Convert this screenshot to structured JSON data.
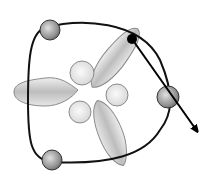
{
  "diagram": {
    "colors": {
      "stroke": "#1a1a1a",
      "lobe_fill": "#d4d4d4",
      "lobe_stroke": "#8a8a8a",
      "sphere_fill": "#9a9a9a",
      "dot": "#000000"
    },
    "spheres": [
      {
        "name": "top-left",
        "cx": 50,
        "cy": 30,
        "r": 10
      },
      {
        "name": "bottom-left",
        "cx": 52,
        "cy": 160,
        "r": 10
      },
      {
        "name": "right",
        "cx": 168,
        "cy": 97,
        "r": 11
      }
    ],
    "center_circles": [
      {
        "cx": 82,
        "cy": 73,
        "r": 12
      },
      {
        "cx": 117,
        "cy": 95,
        "r": 11
      },
      {
        "cx": 80,
        "cy": 112,
        "r": 11
      }
    ],
    "particle": {
      "cx": 132,
      "cy": 39,
      "r": 5
    },
    "arrow": {
      "x1": 132,
      "y1": 39,
      "x2": 200,
      "y2": 134
    }
  }
}
